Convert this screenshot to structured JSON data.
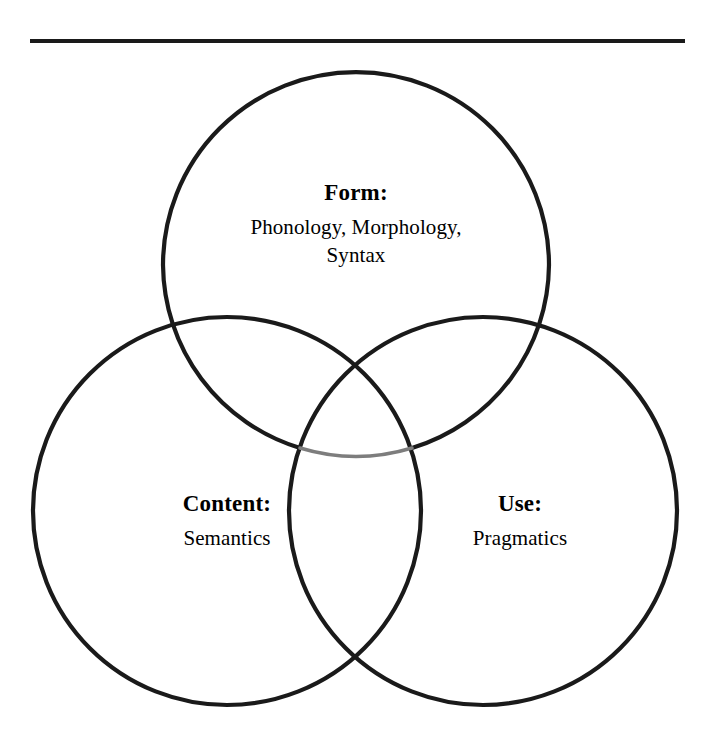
{
  "figure": {
    "background_color": "#ffffff",
    "stroke_color": "#1a1a1a",
    "faded_stroke_color": "#7d7d7d",
    "rule": {
      "name": "top-horizontal-rule",
      "color": "#1a1a1a"
    }
  },
  "diagram": {
    "type": "venn",
    "sets": [
      {
        "key": "form",
        "title": "Form:",
        "body_lines": [
          "Phonology, Morphology,",
          "Syntax"
        ],
        "body_text": "Phonology, Morphology, Syntax",
        "center_x": 356,
        "center_y": 265,
        "radius": 193
      },
      {
        "key": "content",
        "title": "Content:",
        "body_lines": [
          "Semantics"
        ],
        "body_text": "Semantics",
        "center_x": 227,
        "center_y": 511,
        "radius": 194
      },
      {
        "key": "use",
        "title": "Use:",
        "body_lines": [
          "Pragmatics"
        ],
        "body_text": "Pragmatics",
        "center_x": 483,
        "center_y": 511,
        "radius": 194
      }
    ]
  }
}
